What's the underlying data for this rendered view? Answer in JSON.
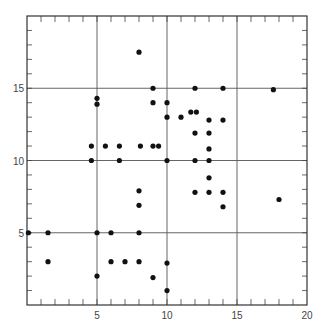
{
  "chart_data": {
    "type": "scatter",
    "title": "",
    "xlabel": "",
    "ylabel": "",
    "xlim": [
      0,
      20
    ],
    "ylim": [
      0,
      20
    ],
    "grid": true,
    "grid_lines_x": [
      5,
      10,
      15
    ],
    "grid_lines_y": [
      5,
      10,
      15
    ],
    "x_tick_labels": [
      "5",
      "10",
      "15",
      "20"
    ],
    "y_tick_labels": [
      "5",
      "10",
      "15"
    ],
    "minor_tick_step": 1,
    "legend": null,
    "marker_color": "#111111",
    "points": [
      [
        8,
        17.5
      ],
      [
        9,
        15
      ],
      [
        12,
        15
      ],
      [
        14,
        15
      ],
      [
        17.6,
        14.9
      ],
      [
        5,
        14.3
      ],
      [
        5,
        13.9
      ],
      [
        9,
        14
      ],
      [
        10,
        14
      ],
      [
        11.7,
        13.35
      ],
      [
        12.1,
        13.35
      ],
      [
        10,
        13
      ],
      [
        11,
        13
      ],
      [
        13,
        12.8
      ],
      [
        14,
        12.8
      ],
      [
        12,
        11.9
      ],
      [
        13,
        11.9
      ],
      [
        4.6,
        11
      ],
      [
        5.6,
        11
      ],
      [
        6.6,
        11
      ],
      [
        8.1,
        11
      ],
      [
        9,
        11
      ],
      [
        9.4,
        11
      ],
      [
        13,
        10.8
      ],
      [
        4.6,
        10
      ],
      [
        6.6,
        10
      ],
      [
        10,
        10
      ],
      [
        12,
        10
      ],
      [
        13,
        10
      ],
      [
        13,
        8.8
      ],
      [
        8,
        7.9
      ],
      [
        12,
        7.8
      ],
      [
        13,
        7.8
      ],
      [
        14,
        7.8
      ],
      [
        18,
        7.3
      ],
      [
        8,
        6.9
      ],
      [
        14,
        6.8
      ],
      [
        0.1,
        5
      ],
      [
        1.5,
        5
      ],
      [
        5,
        5
      ],
      [
        6,
        5
      ],
      [
        8,
        5
      ],
      [
        1.5,
        3
      ],
      [
        6,
        3
      ],
      [
        7,
        3
      ],
      [
        8,
        3
      ],
      [
        10,
        2.9
      ],
      [
        5,
        2
      ],
      [
        9,
        1.9
      ],
      [
        10,
        1
      ]
    ]
  }
}
